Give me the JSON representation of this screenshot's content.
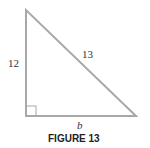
{
  "figure": {
    "caption": "FIGURE 13",
    "shape": "right-triangle",
    "labels": {
      "vertical_side": "12",
      "hypotenuse": "13",
      "base": "b"
    },
    "colors": {
      "stroke": "#a8a8a8",
      "text": "#333333"
    }
  }
}
